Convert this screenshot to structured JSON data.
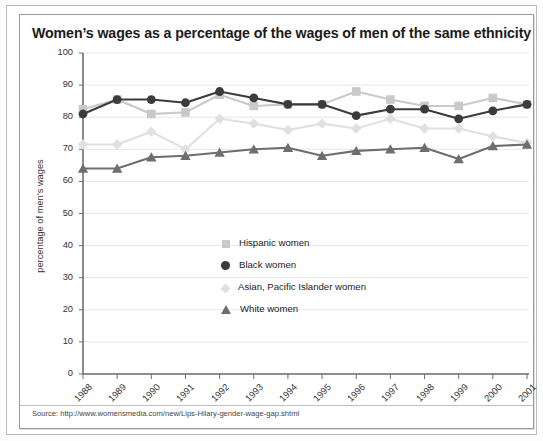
{
  "chart_title": "Women’s wages as a percentage of the wages of men of the same ethnicity",
  "source": "Source: http://www.womensmedia.com/new/Lips-Hilary-gender-wage-gap.shtml",
  "colors": {
    "hispanic": "#c9c9c9",
    "black": "#3b3b3b",
    "asian": "#e0e0e0",
    "white": "#6e6e6e",
    "axis": "#6e6e6e",
    "grid": "#e6e6e6",
    "frame": "#9a9a9a",
    "text": "#1a1a1a"
  },
  "legend": {
    "position": "inside-center",
    "entries": [
      {
        "label": "Hispanic women",
        "marker": "square",
        "color": "#c9c9c9"
      },
      {
        "label": "Black women",
        "marker": "circle",
        "color": "#3b3b3b"
      },
      {
        "label": "Asian, Pacific Islander women",
        "marker": "diamond",
        "color": "#e0e0e0"
      },
      {
        "label": "White women",
        "marker": "triangle",
        "color": "#6e6e6e"
      }
    ]
  },
  "chart_data": {
    "type": "line",
    "title": "Women’s wages as a percentage of the wages of men of the same ethnicity",
    "xlabel": "",
    "ylabel": "percentage of men’s wages",
    "ylim": [
      0,
      100
    ],
    "ytick_step": 10,
    "yticks": [
      0,
      10,
      20,
      30,
      40,
      50,
      60,
      70,
      80,
      90,
      100
    ],
    "grid": true,
    "x": [
      "1988",
      "1989",
      "1990",
      "1991",
      "1992",
      "1993",
      "1994",
      "1995",
      "1996",
      "1997",
      "1998",
      "1999",
      "2000",
      "2001"
    ],
    "categories": [
      "1988",
      "1989",
      "1990",
      "1991",
      "1992",
      "1993",
      "1994",
      "1995",
      "1996",
      "1997",
      "1998",
      "1999",
      "2000",
      "2001"
    ],
    "series": [
      {
        "name": "Hispanic women",
        "marker": "square",
        "color": "#c9c9c9",
        "values": [
          82.5,
          85.5,
          81.0,
          81.5,
          87.0,
          83.5,
          84.0,
          84.0,
          88.0,
          85.5,
          83.5,
          83.5,
          86.0,
          84.0
        ]
      },
      {
        "name": "Black women",
        "marker": "circle",
        "color": "#3b3b3b",
        "values": [
          81.0,
          85.5,
          85.5,
          84.5,
          88.0,
          86.0,
          84.0,
          84.0,
          80.5,
          82.5,
          82.5,
          79.5,
          82.0,
          84.0
        ]
      },
      {
        "name": "Asian, Pacific Islander women",
        "marker": "diamond",
        "color": "#e0e0e0",
        "values": [
          71.5,
          71.5,
          75.5,
          70.0,
          79.5,
          78.0,
          76.0,
          78.0,
          76.5,
          79.5,
          76.5,
          76.5,
          74.0,
          72.0
        ]
      },
      {
        "name": "White women",
        "marker": "triangle",
        "color": "#6e6e6e",
        "values": [
          64.0,
          64.0,
          67.5,
          68.0,
          69.0,
          70.0,
          70.5,
          68.0,
          69.5,
          70.0,
          70.5,
          67.0,
          71.0,
          71.5
        ]
      }
    ],
    "note": "Values read from gridlines; y-axis 0–100 in steps of 10."
  }
}
